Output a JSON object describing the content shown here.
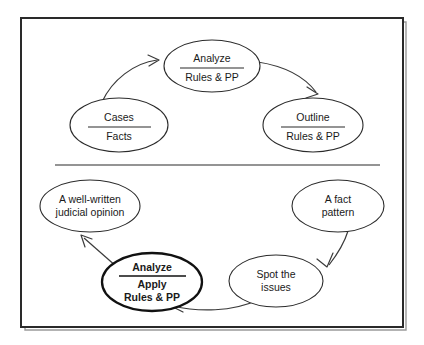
{
  "diagram": {
    "background_color": "#ffffff",
    "frame_color": "#2a2a2a",
    "text_color": "#1a1a1a",
    "divider_rule_color": "#2b2b2b",
    "top_section": {
      "name": "case-study-cycle",
      "nodes": [
        {
          "id": "cases-facts",
          "lines": [
            "Cases",
            "Facts"
          ],
          "has_divider": true,
          "bold": false
        },
        {
          "id": "analyze-rules-pp",
          "lines": [
            "Analyze",
            "Rules & PP"
          ],
          "has_divider": true,
          "bold": false
        },
        {
          "id": "outline-rules-pp",
          "lines": [
            "Outline",
            "Rules & PP"
          ],
          "has_divider": true,
          "bold": false
        }
      ],
      "arrows": [
        {
          "id": "cases-to-analyze",
          "from": "cases-facts",
          "to": "analyze-rules-pp"
        },
        {
          "id": "analyze-to-outline",
          "from": "analyze-rules-pp",
          "to": "outline-rules-pp"
        }
      ]
    },
    "bottom_section": {
      "name": "exam-answer-cycle",
      "nodes": [
        {
          "id": "fact-pattern",
          "lines": [
            "A fact",
            "pattern"
          ],
          "has_divider": false,
          "bold": false
        },
        {
          "id": "spot-the-issues",
          "lines": [
            "Spot the",
            "issues"
          ],
          "has_divider": false,
          "bold": false
        },
        {
          "id": "analyze-apply-rules-pp",
          "lines": [
            "Analyze",
            "Apply",
            "Rules & PP"
          ],
          "has_divider": true,
          "bold": true
        },
        {
          "id": "judicial-opinion",
          "lines": [
            "A well-written",
            "judicial opinion"
          ],
          "has_divider": false,
          "bold": false
        }
      ],
      "arrows": [
        {
          "id": "fact-pattern-to-spot-issues",
          "from": "fact-pattern",
          "to": "spot-the-issues"
        },
        {
          "id": "spot-issues-to-analyze",
          "from": "spot-the-issues",
          "to": "analyze-apply-rules-pp"
        },
        {
          "id": "analyze-to-judicial-opinion",
          "from": "analyze-apply-rules-pp",
          "to": "judicial-opinion"
        }
      ]
    }
  }
}
